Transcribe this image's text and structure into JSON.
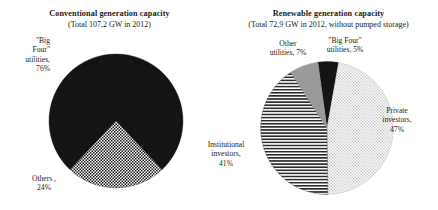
{
  "figure": {
    "background": "#ffffff",
    "width": 438,
    "height": 210
  },
  "chart_data": [
    {
      "type": "pie",
      "id": "conventional-generation-capacity",
      "title": "Conventional generation capacity",
      "subtitle": "(Total 107,2 GW in 2012)",
      "total_label": "Total 107,2 GW in 2012",
      "total_value": 107.2,
      "total_unit": "GW",
      "year": 2012,
      "categories": [
        "\"Big Four\" utilities",
        "Others"
      ],
      "values": [
        76,
        24
      ],
      "value_unit": "%",
      "labels": [
        {
          "name": "\"Big Four\" utilities, 76%",
          "text": "\"Big\nFour\"\nutilities,\n76%",
          "value": 76,
          "fill": "black",
          "position": "left"
        },
        {
          "name": "Others , 24%",
          "text": "Others ,\n24%",
          "value": 24,
          "fill": "checker",
          "position": "bottom-left"
        }
      ],
      "legend": "none",
      "grid": false
    },
    {
      "type": "pie",
      "id": "renewable-generation-capacity",
      "title": "Renewable generation capacity",
      "subtitle": "(Total 72,9 GW in 2012, without pumped storage)",
      "total_label": "Total 72,9 GW in 2012, without pumped storage",
      "total_value": 72.9,
      "total_unit": "GW",
      "year": 2012,
      "categories": [
        "\"Big Four\" utilities",
        "Private investors",
        "Institutional investors",
        "Other utilities"
      ],
      "values": [
        5,
        47,
        41,
        7
      ],
      "value_unit": "%",
      "labels": [
        {
          "name": "\"Big Four\" utilities, 5%",
          "text": "\"Big Four\"\nutilities, 5%",
          "value": 5,
          "fill": "black",
          "position": "top"
        },
        {
          "name": "Private investors, 47%",
          "text": "Private\ninvestors,\n47%",
          "value": 47,
          "fill": "light-dotted",
          "position": "right"
        },
        {
          "name": "Institutional investors, 41%",
          "text": "Institutional\ninvestors,\n41%",
          "value": 41,
          "fill": "horizontal-lines",
          "position": "left"
        },
        {
          "name": "Other utilities, 7%",
          "text": "Other\nutilities, 7%",
          "value": 7,
          "fill": "solid-gray",
          "position": "top-left"
        }
      ],
      "legend": "none",
      "grid": false
    }
  ],
  "colors": {
    "black_slice": "#141414",
    "gray_slice": "#9a9a9a",
    "checker_light": "#ffffff",
    "checker_dark": "#1a1a1a",
    "dotted_light": "#d9d9d9",
    "line_dark": "#2b2b2b",
    "text": "#1d1d1d",
    "outline": "#555555"
  }
}
